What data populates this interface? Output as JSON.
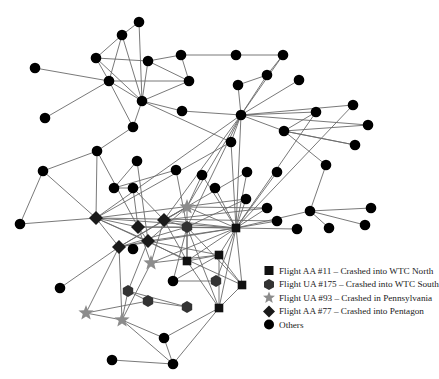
{
  "colors": {
    "edge": "#6a6a6a",
    "circle": "#000000",
    "square": "#111111",
    "hexagon": "#333333",
    "star": "#8c8c8c",
    "diamond": "#1a1a1a"
  },
  "legend": {
    "items": [
      {
        "shape": "square",
        "label": "Flight AA #11 – Crashed into WTC North"
      },
      {
        "shape": "hexagon",
        "label": "Flight UA #175 – Crashed into WTC South"
      },
      {
        "shape": "star",
        "label": "Flight UA #93 – Crashed in Pennsylvania"
      },
      {
        "shape": "diamond",
        "label": "Flight AA #77 – Crashed into Pentagon"
      },
      {
        "shape": "circle",
        "label": "Others"
      }
    ]
  },
  "graph": {
    "nodes": [
      {
        "id": 0,
        "x": 139,
        "y": 22,
        "shape": "circle"
      },
      {
        "id": 1,
        "x": 122,
        "y": 35,
        "shape": "circle"
      },
      {
        "id": 2,
        "x": 96,
        "y": 58,
        "shape": "circle"
      },
      {
        "id": 3,
        "x": 148,
        "y": 61,
        "shape": "circle"
      },
      {
        "id": 4,
        "x": 181,
        "y": 55,
        "shape": "circle"
      },
      {
        "id": 5,
        "x": 35,
        "y": 68,
        "shape": "circle"
      },
      {
        "id": 6,
        "x": 109,
        "y": 81,
        "shape": "circle"
      },
      {
        "id": 7,
        "x": 189,
        "y": 81,
        "shape": "circle"
      },
      {
        "id": 8,
        "x": 142,
        "y": 101,
        "shape": "circle"
      },
      {
        "id": 9,
        "x": 45,
        "y": 118,
        "shape": "circle"
      },
      {
        "id": 10,
        "x": 182,
        "y": 111,
        "shape": "circle"
      },
      {
        "id": 11,
        "x": 133,
        "y": 127,
        "shape": "circle"
      },
      {
        "id": 12,
        "x": 236,
        "y": 55,
        "shape": "circle"
      },
      {
        "id": 13,
        "x": 283,
        "y": 55,
        "shape": "circle"
      },
      {
        "id": 14,
        "x": 267,
        "y": 75,
        "shape": "circle"
      },
      {
        "id": 15,
        "x": 238,
        "y": 85,
        "shape": "circle"
      },
      {
        "id": 16,
        "x": 299,
        "y": 80,
        "shape": "circle"
      },
      {
        "id": 17,
        "x": 241,
        "y": 115,
        "shape": "circle"
      },
      {
        "id": 18,
        "x": 316,
        "y": 112,
        "shape": "circle"
      },
      {
        "id": 19,
        "x": 353,
        "y": 105,
        "shape": "circle"
      },
      {
        "id": 20,
        "x": 368,
        "y": 125,
        "shape": "circle"
      },
      {
        "id": 21,
        "x": 284,
        "y": 131,
        "shape": "circle"
      },
      {
        "id": 22,
        "x": 355,
        "y": 145,
        "shape": "circle"
      },
      {
        "id": 23,
        "x": 231,
        "y": 142,
        "shape": "circle"
      },
      {
        "id": 24,
        "x": 326,
        "y": 165,
        "shape": "circle"
      },
      {
        "id": 25,
        "x": 97,
        "y": 151,
        "shape": "circle"
      },
      {
        "id": 26,
        "x": 43,
        "y": 171,
        "shape": "circle"
      },
      {
        "id": 27,
        "x": 137,
        "y": 161,
        "shape": "circle"
      },
      {
        "id": 28,
        "x": 176,
        "y": 170,
        "shape": "circle"
      },
      {
        "id": 29,
        "x": 114,
        "y": 188,
        "shape": "circle"
      },
      {
        "id": 30,
        "x": 133,
        "y": 188,
        "shape": "circle"
      },
      {
        "id": 31,
        "x": 202,
        "y": 175,
        "shape": "circle"
      },
      {
        "id": 32,
        "x": 247,
        "y": 172,
        "shape": "circle"
      },
      {
        "id": 33,
        "x": 277,
        "y": 172,
        "shape": "circle"
      },
      {
        "id": 34,
        "x": 215,
        "y": 188,
        "shape": "circle"
      },
      {
        "id": 35,
        "x": 20,
        "y": 224,
        "shape": "circle"
      },
      {
        "id": 36,
        "x": 246,
        "y": 199,
        "shape": "circle"
      },
      {
        "id": 37,
        "x": 267,
        "y": 208,
        "shape": "circle"
      },
      {
        "id": 38,
        "x": 310,
        "y": 211,
        "shape": "circle"
      },
      {
        "id": 39,
        "x": 371,
        "y": 208,
        "shape": "circle"
      },
      {
        "id": 40,
        "x": 277,
        "y": 221,
        "shape": "circle"
      },
      {
        "id": 41,
        "x": 297,
        "y": 229,
        "shape": "circle"
      },
      {
        "id": 42,
        "x": 329,
        "y": 228,
        "shape": "circle"
      },
      {
        "id": 43,
        "x": 365,
        "y": 225,
        "shape": "circle"
      },
      {
        "id": 44,
        "x": 96,
        "y": 218,
        "shape": "diamond"
      },
      {
        "id": 45,
        "x": 138,
        "y": 227,
        "shape": "diamond"
      },
      {
        "id": 46,
        "x": 164,
        "y": 220,
        "shape": "diamond"
      },
      {
        "id": 47,
        "x": 148,
        "y": 241,
        "shape": "diamond"
      },
      {
        "id": 48,
        "x": 119,
        "y": 247,
        "shape": "diamond"
      },
      {
        "id": 49,
        "x": 187,
        "y": 207,
        "shape": "star"
      },
      {
        "id": 50,
        "x": 151,
        "y": 263,
        "shape": "star"
      },
      {
        "id": 51,
        "x": 86,
        "y": 313,
        "shape": "star"
      },
      {
        "id": 52,
        "x": 122,
        "y": 320,
        "shape": "star"
      },
      {
        "id": 53,
        "x": 187,
        "y": 227,
        "shape": "hexagon"
      },
      {
        "id": 54,
        "x": 216,
        "y": 281,
        "shape": "hexagon"
      },
      {
        "id": 55,
        "x": 128,
        "y": 291,
        "shape": "hexagon"
      },
      {
        "id": 56,
        "x": 148,
        "y": 301,
        "shape": "hexagon"
      },
      {
        "id": 57,
        "x": 187,
        "y": 307,
        "shape": "hexagon"
      },
      {
        "id": 58,
        "x": 236,
        "y": 228,
        "shape": "square"
      },
      {
        "id": 59,
        "x": 187,
        "y": 261,
        "shape": "square"
      },
      {
        "id": 60,
        "x": 219,
        "y": 255,
        "shape": "square"
      },
      {
        "id": 61,
        "x": 242,
        "y": 285,
        "shape": "square"
      },
      {
        "id": 62,
        "x": 219,
        "y": 308,
        "shape": "square"
      },
      {
        "id": 63,
        "x": 173,
        "y": 281,
        "shape": "circle"
      },
      {
        "id": 64,
        "x": 60,
        "y": 288,
        "shape": "circle"
      },
      {
        "id": 65,
        "x": 164,
        "y": 338,
        "shape": "circle"
      },
      {
        "id": 66,
        "x": 112,
        "y": 360,
        "shape": "circle"
      },
      {
        "id": 67,
        "x": 173,
        "y": 364,
        "shape": "circle"
      },
      {
        "id": 68,
        "x": 133,
        "y": 249,
        "shape": "circle"
      }
    ],
    "edges": [
      [
        0,
        1
      ],
      [
        0,
        8
      ],
      [
        1,
        2
      ],
      [
        1,
        6
      ],
      [
        1,
        8
      ],
      [
        2,
        3
      ],
      [
        2,
        6
      ],
      [
        2,
        8
      ],
      [
        3,
        4
      ],
      [
        3,
        7
      ],
      [
        3,
        8
      ],
      [
        4,
        12
      ],
      [
        4,
        7
      ],
      [
        5,
        6
      ],
      [
        6,
        7
      ],
      [
        6,
        8
      ],
      [
        6,
        11
      ],
      [
        7,
        8
      ],
      [
        8,
        10
      ],
      [
        8,
        11
      ],
      [
        8,
        23
      ],
      [
        9,
        6
      ],
      [
        10,
        17
      ],
      [
        12,
        13
      ],
      [
        13,
        14
      ],
      [
        13,
        17
      ],
      [
        14,
        15
      ],
      [
        14,
        17
      ],
      [
        15,
        17
      ],
      [
        16,
        17
      ],
      [
        17,
        18
      ],
      [
        17,
        19
      ],
      [
        17,
        20
      ],
      [
        17,
        21
      ],
      [
        17,
        23
      ],
      [
        18,
        21
      ],
      [
        21,
        20
      ],
      [
        21,
        22
      ],
      [
        21,
        24
      ],
      [
        24,
        38
      ],
      [
        22,
        21
      ],
      [
        11,
        25
      ],
      [
        25,
        26
      ],
      [
        25,
        44
      ],
      [
        25,
        45
      ],
      [
        26,
        35
      ],
      [
        26,
        44
      ],
      [
        27,
        29
      ],
      [
        27,
        47
      ],
      [
        28,
        29
      ],
      [
        28,
        53
      ],
      [
        29,
        30
      ],
      [
        30,
        45
      ],
      [
        30,
        46
      ],
      [
        23,
        44
      ],
      [
        23,
        58
      ],
      [
        31,
        58
      ],
      [
        32,
        58
      ],
      [
        33,
        58
      ],
      [
        34,
        58
      ],
      [
        17,
        58
      ],
      [
        17,
        49
      ],
      [
        17,
        53
      ],
      [
        17,
        46
      ],
      [
        17,
        44
      ],
      [
        19,
        58
      ],
      [
        18,
        58
      ],
      [
        36,
        58
      ],
      [
        37,
        58
      ],
      [
        38,
        58
      ],
      [
        38,
        39
      ],
      [
        38,
        43
      ],
      [
        38,
        42
      ],
      [
        40,
        58
      ],
      [
        41,
        58
      ],
      [
        37,
        49
      ],
      [
        36,
        53
      ],
      [
        44,
        35
      ],
      [
        44,
        45
      ],
      [
        44,
        48
      ],
      [
        44,
        47
      ],
      [
        44,
        58
      ],
      [
        44,
        61
      ],
      [
        45,
        47
      ],
      [
        45,
        53
      ],
      [
        45,
        58
      ],
      [
        46,
        49
      ],
      [
        46,
        58
      ],
      [
        46,
        53
      ],
      [
        46,
        48
      ],
      [
        46,
        59
      ],
      [
        47,
        48
      ],
      [
        47,
        58
      ],
      [
        47,
        59
      ],
      [
        47,
        60
      ],
      [
        48,
        58
      ],
      [
        48,
        53
      ],
      [
        48,
        51
      ],
      [
        48,
        52
      ],
      [
        48,
        64
      ],
      [
        49,
        58
      ],
      [
        49,
        48
      ],
      [
        49,
        47
      ],
      [
        49,
        31
      ],
      [
        49,
        59
      ],
      [
        50,
        46
      ],
      [
        50,
        52
      ],
      [
        50,
        58
      ],
      [
        50,
        60
      ],
      [
        53,
        58
      ],
      [
        53,
        59
      ],
      [
        53,
        61
      ],
      [
        53,
        62
      ],
      [
        58,
        59
      ],
      [
        58,
        60
      ],
      [
        58,
        61
      ],
      [
        58,
        62
      ],
      [
        59,
        60
      ],
      [
        59,
        62
      ],
      [
        60,
        61
      ],
      [
        60,
        62
      ],
      [
        60,
        63
      ],
      [
        61,
        62
      ],
      [
        63,
        54
      ],
      [
        54,
        58
      ],
      [
        55,
        56
      ],
      [
        55,
        57
      ],
      [
        56,
        57
      ],
      [
        55,
        52
      ],
      [
        56,
        51
      ],
      [
        51,
        52
      ],
      [
        52,
        65
      ],
      [
        52,
        67
      ],
      [
        65,
        67
      ],
      [
        65,
        62
      ],
      [
        66,
        67
      ],
      [
        62,
        67
      ],
      [
        45,
        50
      ],
      [
        47,
        55
      ],
      [
        53,
        63
      ],
      [
        44,
        36
      ],
      [
        44,
        40
      ],
      [
        46,
        32
      ],
      [
        46,
        37
      ]
    ]
  }
}
